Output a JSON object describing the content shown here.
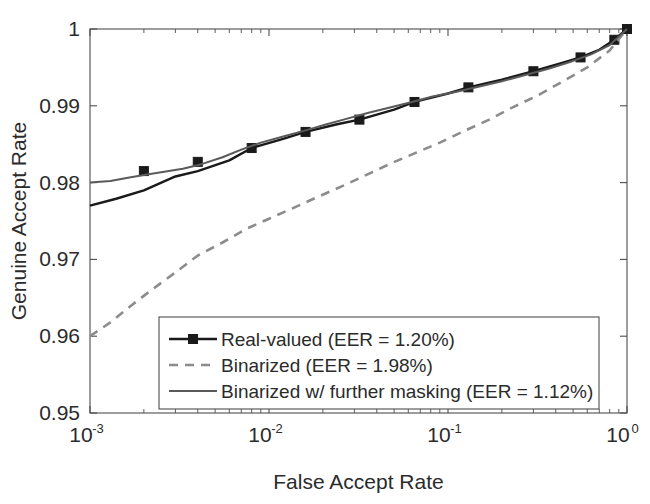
{
  "chart_data": {
    "type": "line",
    "title": "",
    "xlabel": "False Accept Rate",
    "ylabel": "Genuine Accept Rate",
    "xscale": "log",
    "yscale": "linear",
    "xlim": [
      0.001,
      1.0
    ],
    "ylim": [
      0.95,
      1.0
    ],
    "grid": false,
    "legend_position": "lower center",
    "xticks": [
      {
        "value": 0.001,
        "base": "10",
        "exponent": "-3"
      },
      {
        "value": 0.01,
        "base": "10",
        "exponent": "-2"
      },
      {
        "value": 0.1,
        "base": "10",
        "exponent": "-1"
      },
      {
        "value": 1.0,
        "base": "10",
        "exponent": "0"
      }
    ],
    "yticks": [
      {
        "value": 0.95,
        "label": "0.95"
      },
      {
        "value": 0.96,
        "label": "0.96"
      },
      {
        "value": 0.97,
        "label": "0.97"
      },
      {
        "value": 0.98,
        "label": "0.98"
      },
      {
        "value": 0.99,
        "label": "0.99"
      },
      {
        "value": 1.0,
        "label": "1"
      }
    ],
    "series": [
      {
        "name": "Real-valued (EER = 1.20%)",
        "style": "solid-marker",
        "color": "#1a1a1a",
        "marker": "square",
        "x": [
          0.001,
          0.0014,
          0.002,
          0.003,
          0.004,
          0.006,
          0.008,
          0.012,
          0.016,
          0.024,
          0.032,
          0.05,
          0.065,
          0.1,
          0.13,
          0.2,
          0.3,
          0.42,
          0.55,
          0.7,
          0.85,
          1.0
        ],
        "y": [
          0.977,
          0.9779,
          0.979,
          0.9808,
          0.9815,
          0.9829,
          0.9845,
          0.9857,
          0.9866,
          0.9876,
          0.9882,
          0.9895,
          0.9905,
          0.9916,
          0.9924,
          0.9934,
          0.9945,
          0.9955,
          0.9963,
          0.9973,
          0.9986,
          1.0
        ],
        "marker_x": [
          0.002,
          0.004,
          0.008,
          0.016,
          0.032,
          0.065,
          0.13,
          0.3,
          0.55,
          0.85,
          1.0
        ],
        "marker_y": [
          0.9815,
          0.9827,
          0.9845,
          0.9866,
          0.9882,
          0.9905,
          0.9924,
          0.9945,
          0.9963,
          0.9986,
          1.0
        ]
      },
      {
        "name": "Binarized (EER = 1.98%)",
        "style": "dashed",
        "color": "#8c8c8c",
        "x": [
          0.001,
          0.0013,
          0.0017,
          0.0022,
          0.003,
          0.004,
          0.0055,
          0.0075,
          0.01,
          0.014,
          0.019,
          0.026,
          0.035,
          0.048,
          0.065,
          0.09,
          0.12,
          0.17,
          0.23,
          0.32,
          0.44,
          0.6,
          0.8,
          1.0
        ],
        "y": [
          0.96,
          0.9618,
          0.964,
          0.966,
          0.9683,
          0.9705,
          0.9722,
          0.974,
          0.9753,
          0.9768,
          0.9782,
          0.9796,
          0.981,
          0.9825,
          0.9838,
          0.9852,
          0.9866,
          0.9882,
          0.9898,
          0.9914,
          0.9932,
          0.995,
          0.9972,
          1.0
        ]
      },
      {
        "name": "Binarized w/ further masking (EER = 1.12%)",
        "style": "solid",
        "color": "#5a5a5a",
        "x": [
          0.001,
          0.0013,
          0.0016,
          0.002,
          0.0026,
          0.0033,
          0.0042,
          0.0055,
          0.007,
          0.009,
          0.012,
          0.016,
          0.021,
          0.028,
          0.036,
          0.048,
          0.063,
          0.082,
          0.11,
          0.15,
          0.2,
          0.27,
          0.36,
          0.48,
          0.63,
          0.8,
          1.0
        ],
        "y": [
          0.98,
          0.9802,
          0.9806,
          0.981,
          0.9814,
          0.9818,
          0.9824,
          0.9833,
          0.9843,
          0.9852,
          0.986,
          0.9868,
          0.9876,
          0.9884,
          0.9891,
          0.9898,
          0.9905,
          0.9912,
          0.9918,
          0.9925,
          0.9932,
          0.994,
          0.9948,
          0.9957,
          0.9967,
          0.9979,
          1.0
        ]
      }
    ]
  },
  "legend": {
    "entries": [
      {
        "label": "Real-valued (EER = 1.20%)",
        "style": "solid-marker"
      },
      {
        "label": "Binarized (EER = 1.98%)",
        "style": "dashed"
      },
      {
        "label": "Binarized w/ further masking (EER = 1.12%)",
        "style": "solid"
      }
    ]
  },
  "colors": {
    "axis": "#4d4d4d",
    "text": "#2b2b2b",
    "real_valued": "#1a1a1a",
    "binarized": "#8c8c8c",
    "binarized_masked": "#5a5a5a",
    "background": "#ffffff"
  }
}
